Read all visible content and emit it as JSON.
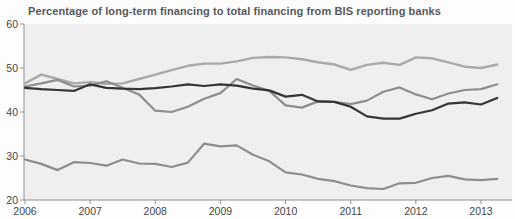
{
  "title": "Percentage of long-term financing to total financing from BIS reporting banks",
  "colors": {
    "figure_background": "#fdfdfd",
    "plot_background": "#efeff0",
    "axis": "#8f8f90",
    "title_text": "#58585b",
    "tick_text": "#454548"
  },
  "chart_data": {
    "type": "line",
    "title": "Percentage of long-term financing to total financing from BIS reporting banks",
    "xlabel": "",
    "ylabel": "",
    "xlim": [
      2006.0,
      2013.5
    ],
    "ylim": [
      20,
      60
    ],
    "y_ticks": [
      20,
      30,
      40,
      50,
      60
    ],
    "x_ticks": [
      2006,
      2007,
      2008,
      2009,
      2010,
      2011,
      2012,
      2013
    ],
    "x_tick_labels": [
      "2006",
      "2007",
      "2008",
      "2009",
      "2010",
      "2011",
      "2012",
      "2013"
    ],
    "grid": false,
    "legend_position": "none",
    "x_frequency": "quarterly",
    "x": [
      2006.0,
      2006.25,
      2006.5,
      2006.75,
      2007.0,
      2007.25,
      2007.5,
      2007.75,
      2008.0,
      2008.25,
      2008.5,
      2008.75,
      2009.0,
      2009.25,
      2009.5,
      2009.75,
      2010.0,
      2010.25,
      2010.5,
      2010.75,
      2011.0,
      2011.25,
      2011.5,
      2011.75,
      2012.0,
      2012.25,
      2012.5,
      2012.75,
      2013.0,
      2013.25
    ],
    "series": [
      {
        "name": "upper-light-gray-line",
        "color": "#a9a9aa",
        "width": 2.4,
        "values": [
          46.5,
          48.5,
          47.5,
          46.5,
          46.8,
          46.4,
          46.5,
          47.5,
          48.5,
          49.5,
          50.5,
          51.0,
          51.0,
          51.5,
          52.3,
          52.5,
          52.4,
          52.0,
          51.3,
          50.8,
          49.6,
          50.7,
          51.2,
          50.7,
          52.4,
          52.2,
          51.3,
          50.3,
          50.0,
          50.8
        ]
      },
      {
        "name": "medium-gray-line",
        "color": "#8d8d8e",
        "width": 2.2,
        "values": [
          45.8,
          46.5,
          47.3,
          45.8,
          46.0,
          47.0,
          45.5,
          44.0,
          40.3,
          40.0,
          41.2,
          43.0,
          44.3,
          47.5,
          46.0,
          44.8,
          41.5,
          41.0,
          42.4,
          42.3,
          41.8,
          42.6,
          44.6,
          45.6,
          44.0,
          42.9,
          44.2,
          45.0,
          45.2,
          46.3
        ]
      },
      {
        "name": "lower-gray-line",
        "color": "#8d8d8e",
        "width": 2.2,
        "values": [
          29.2,
          28.2,
          26.8,
          28.6,
          28.4,
          27.8,
          29.2,
          28.3,
          28.2,
          27.5,
          28.5,
          32.8,
          32.2,
          32.4,
          30.3,
          28.8,
          26.3,
          25.8,
          24.8,
          24.3,
          23.3,
          22.7,
          22.5,
          23.8,
          23.9,
          25.0,
          25.5,
          24.7,
          24.5,
          24.8
        ]
      },
      {
        "name": "black-line",
        "color": "#353537",
        "width": 2.2,
        "values": [
          45.5,
          45.2,
          45.0,
          44.8,
          46.3,
          45.5,
          45.3,
          45.2,
          45.4,
          45.8,
          46.3,
          45.9,
          46.3,
          46.0,
          45.3,
          44.9,
          43.5,
          43.9,
          42.4,
          42.3,
          41.2,
          39.0,
          38.5,
          38.5,
          39.6,
          40.4,
          41.9,
          42.2,
          41.7,
          43.2
        ]
      }
    ],
    "plot_area": {
      "left": 24,
      "right": 512,
      "top": 24,
      "bottom": 200
    }
  }
}
